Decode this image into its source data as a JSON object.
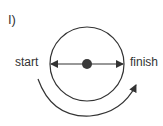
{
  "diagram": {
    "panel_label": "I)",
    "start_label": "start",
    "finish_label": "finish",
    "elements": {
      "circle": {
        "cx": 87,
        "cy": 64,
        "r": 37
      },
      "center_dot": {
        "cx": 87,
        "cy": 64,
        "r": 5
      },
      "diameter_arrow": {
        "from": "center",
        "to": [
          "left-edge",
          "right-edge"
        ],
        "style": "double-headed"
      },
      "rotation_arc": {
        "direction": "counter-clockwise-under (left to right along bottom)",
        "from": "start",
        "to": "finish"
      }
    },
    "colors": {
      "stroke": "#333333",
      "dot": "#3a3a3a",
      "text": "#333333"
    }
  }
}
